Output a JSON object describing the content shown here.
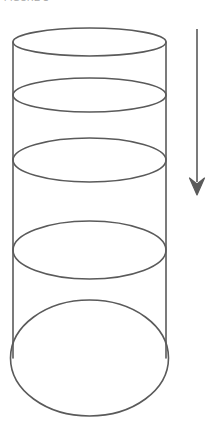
{
  "figure": {
    "caption": "FIGURE 1",
    "caption_color": "#a8a8a8",
    "background_color": "#ffffff",
    "stroke_color": "#5a5a5a",
    "stroke_width": 1.6,
    "width": 221,
    "height": 429
  },
  "chart_data": {
    "type": "diagram",
    "title": "FIGURE 1",
    "xlabel": "",
    "ylabel": "",
    "grid": false,
    "legend": "none",
    "cylinder": {
      "label": "cylinder-body",
      "left_wall_x": 13,
      "right_wall_x": 166,
      "radius_x": 76.5,
      "center_x": 89.5,
      "wall_top_y": 42,
      "wall_bottom_y": 358
    },
    "cross_sections": [
      {
        "name": "section-1-top",
        "index": 1,
        "cy": 42,
        "rx": 76.5,
        "ry": 14,
        "openness": 0.18
      },
      {
        "name": "section-2",
        "index": 2,
        "cy": 95,
        "rx": 76.5,
        "ry": 17,
        "openness": 0.22
      },
      {
        "name": "section-3",
        "index": 3,
        "cy": 160,
        "rx": 76.5,
        "ry": 22,
        "openness": 0.29
      },
      {
        "name": "section-4",
        "index": 4,
        "cy": 250,
        "rx": 76.5,
        "ry": 29,
        "openness": 0.38
      },
      {
        "name": "section-5-bottom",
        "index": 5,
        "cy": 358,
        "rx": 79.0,
        "ry": 58,
        "openness": 0.73
      }
    ],
    "arrow": {
      "name": "direction-arrow",
      "direction": "down",
      "x": 197,
      "y_start": 29,
      "y_end": 195,
      "head_width": 15,
      "head_length": 17
    }
  }
}
